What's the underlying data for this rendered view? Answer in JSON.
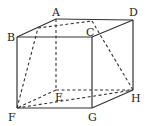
{
  "diagram": {
    "type": "cuboid with inscribed dashed section",
    "vertices": {
      "A": {
        "x": 56,
        "y": 19
      },
      "B": {
        "x": 17,
        "y": 37
      },
      "C": {
        "x": 92,
        "y": 37
      },
      "D": {
        "x": 133,
        "y": 20
      },
      "E": {
        "x": 56,
        "y": 90
      },
      "F": {
        "x": 17,
        "y": 108
      },
      "G": {
        "x": 92,
        "y": 108
      },
      "H": {
        "x": 133,
        "y": 90
      }
    },
    "labels": {
      "A": "A",
      "B": "B",
      "C": "C",
      "D": "D",
      "E": "E",
      "F": "F",
      "G": "G",
      "H": "H"
    },
    "section_points": {
      "P": {
        "x": 38,
        "y": 28
      },
      "Q": {
        "x": 92,
        "y": 21
      }
    },
    "colors": {
      "line": "#333333",
      "label": "#222222",
      "background": "#ffffff"
    }
  }
}
